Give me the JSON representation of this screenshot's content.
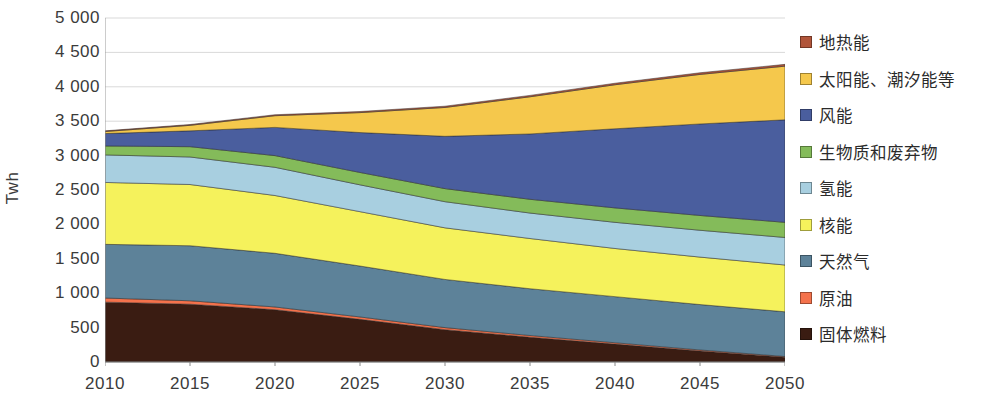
{
  "axes": {
    "y_label": "Twh",
    "y_ticks": [
      "5 000",
      "4 500",
      "4 000",
      "3 500",
      "3 000",
      "2 500",
      "2 000",
      "1 500",
      "1 000",
      "500",
      "0"
    ],
    "y_tick_values": [
      5000,
      4500,
      4000,
      3500,
      3000,
      2500,
      2000,
      1500,
      1000,
      500,
      0
    ],
    "x_ticks": [
      "2010",
      "2015",
      "2020",
      "2025",
      "2030",
      "2035",
      "2040",
      "2045",
      "2050"
    ]
  },
  "legend": {
    "items": [
      {
        "label": "地热能",
        "color": "#b1553a"
      },
      {
        "label": "太阳能、潮汐能等",
        "color": "#f5c84c"
      },
      {
        "label": "风能",
        "color": "#4a5e9e"
      },
      {
        "label": "生物质和废弃物",
        "color": "#84bb5a"
      },
      {
        "label": "氢能",
        "color": "#a8cfe0"
      },
      {
        "label": "核能",
        "color": "#f5f25c"
      },
      {
        "label": "天然气",
        "color": "#5d8299"
      },
      {
        "label": "原油",
        "color": "#f4724c"
      },
      {
        "label": "固体燃料",
        "color": "#3a1c12"
      }
    ]
  },
  "chart_data": {
    "type": "area",
    "title": "",
    "xlabel": "",
    "ylabel": "Twh",
    "ylim": [
      0,
      5000
    ],
    "xlim": [
      2010,
      2050
    ],
    "grid": true,
    "legend_position": "right",
    "stacked": true,
    "x": [
      2010,
      2015,
      2020,
      2025,
      2030,
      2035,
      2040,
      2045,
      2050
    ],
    "series": [
      {
        "name": "固体燃料",
        "color": "#3a1c12",
        "values": [
          870,
          840,
          760,
          620,
          470,
          360,
          260,
          160,
          70
        ]
      },
      {
        "name": "原油",
        "color": "#f4724c",
        "values": [
          60,
          50,
          40,
          35,
          30,
          25,
          20,
          15,
          10
        ]
      },
      {
        "name": "天然气",
        "color": "#5d8299",
        "values": [
          780,
          800,
          780,
          740,
          700,
          680,
          670,
          660,
          650
        ]
      },
      {
        "name": "核能",
        "color": "#f5f25c",
        "values": [
          900,
          890,
          840,
          790,
          750,
          730,
          700,
          690,
          680
        ]
      },
      {
        "name": "氢能",
        "color": "#a8cfe0",
        "values": [
          400,
          400,
          410,
          390,
          380,
          370,
          380,
          390,
          400
        ]
      },
      {
        "name": "生物质和废弃物",
        "color": "#84bb5a",
        "values": [
          130,
          150,
          170,
          180,
          190,
          200,
          210,
          215,
          220
        ]
      },
      {
        "name": "风能",
        "color": "#4a5e9e",
        "values": [
          180,
          230,
          410,
          580,
          760,
          950,
          1150,
          1330,
          1490
        ]
      },
      {
        "name": "太阳能、潮汐能等",
        "color": "#f5c84c",
        "values": [
          30,
          80,
          170,
          290,
          420,
          540,
          640,
          720,
          780
        ]
      },
      {
        "name": "地热能",
        "color": "#b1553a",
        "values": [
          10,
          12,
          14,
          16,
          18,
          20,
          22,
          24,
          26
        ]
      }
    ],
    "totals": [
      3360,
      3452,
      3594,
      3641,
      3718,
      3875,
      4052,
      4204,
      4326
    ]
  }
}
